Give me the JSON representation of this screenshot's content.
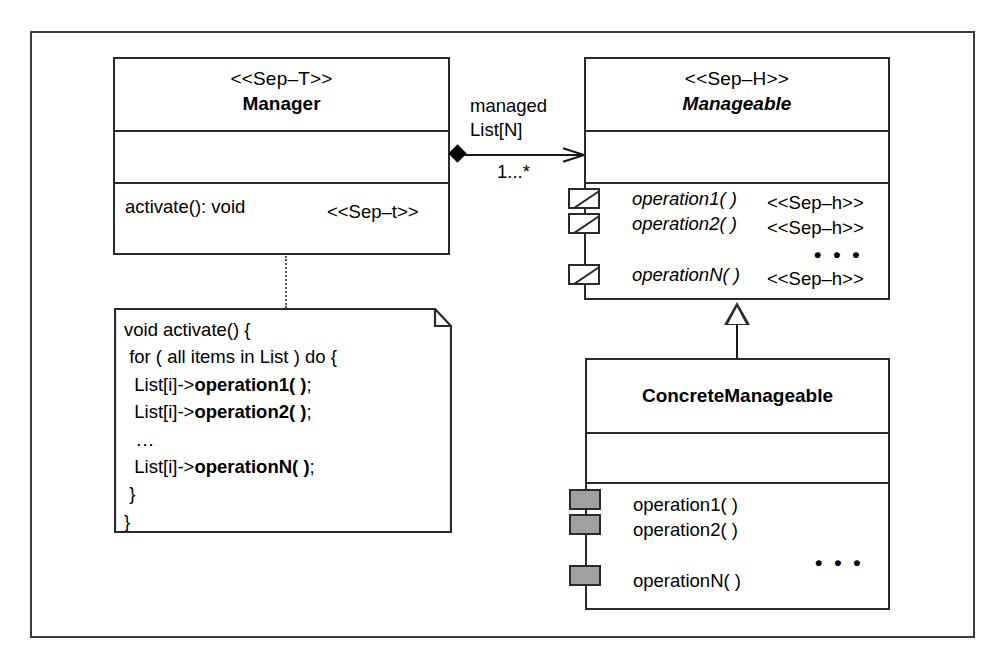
{
  "diagram": {
    "kind": "uml-class-diagram",
    "colors": {
      "frame_border": "#3c3c3c",
      "class_border": "#2a2a2a",
      "background": "#ffffff",
      "impl_port_fill": "#a0a0a0",
      "line": "#1a1a1a"
    }
  },
  "manager_class": {
    "stereotype": "<<Sep–T>>",
    "name": "Manager",
    "attributes": [],
    "operations": [
      {
        "signature": "activate(): void",
        "stereotype": "<<Sep–t>>"
      }
    ]
  },
  "manageable_class": {
    "stereotype": "<<Sep–H>>",
    "name": "Manageable",
    "abstract": true,
    "attributes": [],
    "operations": [
      {
        "signature": "operation1( )",
        "stereotype": "<<Sep–h>>",
        "port": "interface-port"
      },
      {
        "signature": "operation2( )",
        "stereotype": "<<Sep–h>>",
        "port": "interface-port"
      },
      {
        "signature": "operationN( )",
        "stereotype": "<<Sep–h>>",
        "port": "interface-port"
      }
    ],
    "ellipsis": "• • •"
  },
  "concrete_class": {
    "stereotype": "",
    "name": "ConcreteManageable",
    "abstract": false,
    "attributes": [],
    "operations": [
      {
        "signature": "operation1( )",
        "port": "implementation-port"
      },
      {
        "signature": "operation2( )",
        "port": "implementation-port"
      },
      {
        "signature": "operationN( )",
        "port": "implementation-port"
      }
    ],
    "ellipsis": "• • •"
  },
  "association": {
    "role_line1": "managed",
    "role_line2": "List[N]",
    "multiplicity": "1...*",
    "source_end": "filled-diamond",
    "target_end": "open-arrow"
  },
  "generalization": {
    "end": "hollow-triangle",
    "from": "ConcreteManageable",
    "to": "Manageable"
  },
  "note": {
    "line1": "void activate() {",
    "line2": " for ( all items in List ) do {",
    "line3_prefix": "  List[i]->",
    "line3_bold": "operation1( )",
    "line3_suffix": ";",
    "line4_prefix": "  List[i]->",
    "line4_bold": "operation2( )",
    "line4_suffix": ";",
    "line5": "  ...",
    "line6_prefix": "  List[i]->",
    "line6_bold": "operationN( )",
    "line6_suffix": ";",
    "line7": " }",
    "line8": "}"
  }
}
